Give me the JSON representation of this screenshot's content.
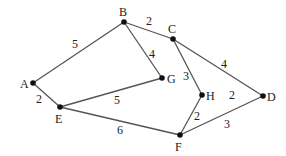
{
  "graph": {
    "type": "weighted-undirected-graph",
    "colors": {
      "edge": "#555555",
      "node": "#111111",
      "text": "#222222",
      "background": "#ffffff"
    },
    "nodes": [
      {
        "id": "A",
        "label": "A",
        "x": 33,
        "y": 83,
        "lx": 20,
        "ly": 88
      },
      {
        "id": "B",
        "label": "B",
        "x": 124,
        "y": 22,
        "lx": 119,
        "ly": 16
      },
      {
        "id": "C",
        "label": "C",
        "x": 173,
        "y": 39,
        "lx": 168,
        "ly": 33
      },
      {
        "id": "D",
        "label": "D",
        "x": 263,
        "y": 96,
        "lx": 267,
        "ly": 101
      },
      {
        "id": "E",
        "label": "E",
        "x": 60,
        "y": 107,
        "lx": 55,
        "ly": 123
      },
      {
        "id": "F",
        "label": "F",
        "x": 180,
        "y": 135,
        "lx": 175,
        "ly": 151
      },
      {
        "id": "G",
        "label": "G",
        "x": 162,
        "y": 78,
        "lx": 167,
        "ly": 83
      },
      {
        "id": "H",
        "label": "H",
        "x": 202,
        "y": 95,
        "lx": 206,
        "ly": 100
      }
    ],
    "edges": [
      {
        "from": "A",
        "to": "B",
        "weight": "5",
        "wx": 72,
        "wy": 48
      },
      {
        "from": "A",
        "to": "E",
        "weight": "2",
        "wx": 36,
        "wy": 103
      },
      {
        "from": "B",
        "to": "C",
        "weight": "2",
        "wx": 146,
        "wy": 25
      },
      {
        "from": "B",
        "to": "G",
        "weight": "4",
        "wx": 149,
        "wy": 58
      },
      {
        "from": "C",
        "to": "H",
        "weight": "3",
        "wx": 183,
        "wy": 80
      },
      {
        "from": "C",
        "to": "D",
        "weight": "4",
        "wx": 221,
        "wy": 68
      },
      {
        "from": "E",
        "to": "G",
        "weight": "5",
        "wx": 114,
        "wy": 104
      },
      {
        "from": "E",
        "to": "F",
        "weight": "6",
        "wx": 117,
        "wy": 134
      },
      {
        "from": "H",
        "to": "F",
        "weight": "2",
        "wx": 194,
        "wy": 120
      },
      {
        "from": "F",
        "to": "D",
        "weight": "3",
        "wx": 224,
        "wy": 128
      }
    ],
    "floating_labels": [
      {
        "text": "2",
        "x": 229,
        "y": 99
      }
    ]
  }
}
